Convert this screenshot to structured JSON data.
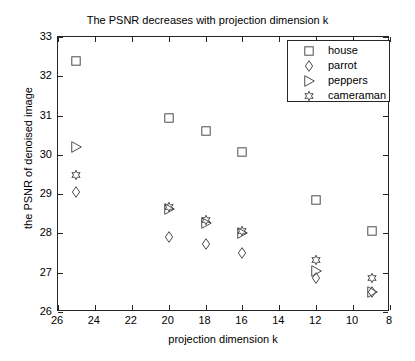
{
  "chart_data": {
    "type": "scatter",
    "title": "The PSNR decreases with projection dimension k",
    "xlabel": "projection dimension k",
    "ylabel": "the PSNR of denoised image",
    "xlim": [
      26,
      8
    ],
    "ylim": [
      26,
      33
    ],
    "x_reversed": true,
    "grid": false,
    "xticks": [
      26,
      24,
      22,
      20,
      18,
      16,
      14,
      12,
      10,
      8
    ],
    "yticks": [
      26,
      27,
      28,
      29,
      30,
      31,
      32,
      33
    ],
    "legend_position": "top-right",
    "series": [
      {
        "name": "house",
        "marker": "square",
        "x": [
          25,
          20,
          18,
          16,
          12,
          9
        ],
        "y": [
          32.39,
          30.95,
          30.6,
          30.07,
          28.85,
          28.05
        ]
      },
      {
        "name": "parrot",
        "marker": "diamond",
        "x": [
          25,
          20,
          18,
          16,
          12,
          9
        ],
        "y": [
          29.05,
          27.9,
          27.73,
          27.5,
          26.86,
          26.5
        ]
      },
      {
        "name": "peppers",
        "marker": "triangle-right",
        "x": [
          25,
          20,
          18,
          16,
          12,
          9
        ],
        "y": [
          30.2,
          28.62,
          28.27,
          28.0,
          27.05,
          26.52
        ]
      },
      {
        "name": "cameraman",
        "marker": "hexagram",
        "x": [
          25,
          20,
          18,
          16,
          12,
          9
        ],
        "y": [
          29.5,
          28.68,
          28.33,
          28.05,
          27.33,
          26.86
        ]
      }
    ]
  },
  "axes": {
    "xtick_labels": [
      "26",
      "24",
      "22",
      "20",
      "18",
      "16",
      "14",
      "12",
      "10",
      "8"
    ],
    "ytick_labels": [
      "26",
      "27",
      "28",
      "29",
      "30",
      "31",
      "32",
      "33"
    ],
    "x_title": "projection dimension k",
    "y_title": "the PSNR of denoised image"
  },
  "legend": {
    "entries": [
      {
        "label": "house",
        "marker": "square-marker"
      },
      {
        "label": "parrot",
        "marker": "diamond-marker"
      },
      {
        "label": "peppers",
        "marker": "triangle-right-marker"
      },
      {
        "label": "cameraman",
        "marker": "hexagram-marker"
      }
    ]
  },
  "colors": {
    "axis": "#262626",
    "marker": "#4d4d4d",
    "background": "#ffffff"
  }
}
